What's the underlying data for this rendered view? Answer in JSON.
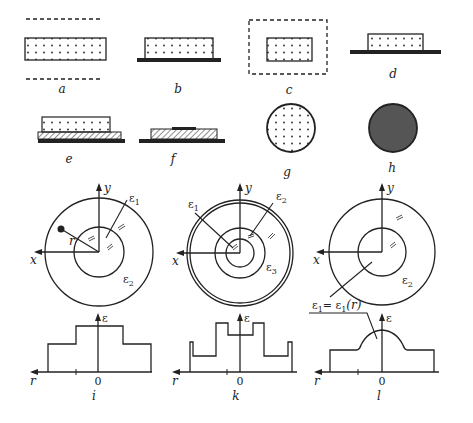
{
  "panels": {
    "a": {
      "label": "a",
      "description": "dotted slab between two dashed lines"
    },
    "b": {
      "label": "b",
      "description": "dotted slab on solid substrate"
    },
    "c": {
      "label": "c",
      "description": "dotted rectangle in dashed rectangle"
    },
    "d": {
      "label": "d",
      "description": "dotted block on solid line"
    },
    "e": {
      "label": "e",
      "description": "dotted slab on hatched layer on substrate"
    },
    "f": {
      "label": "f",
      "description": "hatched layer with dark strip on substrate"
    },
    "g": {
      "label": "g",
      "description": "dotted circle"
    },
    "h": {
      "label": "h",
      "description": "filled dark circle"
    },
    "i": {
      "label": "i",
      "axis_x": "x",
      "axis_y": "y",
      "r_label": "r",
      "eps1": "ε",
      "eps1_sub": "1",
      "eps2": "ε",
      "eps2_sub": "2",
      "profile_axis": "ε",
      "profile_r": "r",
      "profile_zero": "0"
    },
    "k": {
      "label": "k",
      "axis_x": "x",
      "axis_y": "y",
      "eps1": "ε",
      "eps1_sub": "1",
      "eps2": "ε",
      "eps2_sub": "2",
      "eps3": "ε",
      "eps3_sub": "3",
      "profile_axis": "ε",
      "profile_r": "r",
      "profile_zero": "0"
    },
    "l": {
      "label": "l",
      "axis_x": "x",
      "axis_y": "y",
      "eps2": "ε",
      "eps2_sub": "2",
      "eps1_formula_a": "ε",
      "eps1_formula_sub": "1",
      "eps1_formula_b": "= ε",
      "eps1_formula_sub2": "1",
      "eps1_formula_c": "(r)",
      "profile_axis": "ε",
      "profile_r": "r",
      "profile_zero": "0"
    }
  },
  "colors": {
    "ink": "#222222",
    "fill_dark": "#555555",
    "hatch": "#888888",
    "background": "#ffffff"
  }
}
